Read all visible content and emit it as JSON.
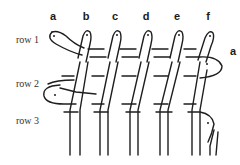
{
  "diagram": {
    "type": "weaving-pattern",
    "strand_labels": [
      {
        "label": "a",
        "x": 53,
        "y": 14
      },
      {
        "label": "b",
        "x": 86,
        "y": 14
      },
      {
        "label": "c",
        "x": 115,
        "y": 14
      },
      {
        "label": "d",
        "x": 146,
        "y": 14
      },
      {
        "label": "e",
        "x": 177,
        "y": 14
      },
      {
        "label": "f",
        "x": 208,
        "y": 14
      }
    ],
    "side_label": {
      "label": "a",
      "x": 233,
      "y": 47
    },
    "row_labels": [
      {
        "label": "row 1",
        "y": 34
      },
      {
        "label": "row 2",
        "y": 78
      },
      {
        "label": "row 3",
        "y": 115
      }
    ],
    "colors": {
      "stroke": "#1e1e1e",
      "text": "#1a1a1a",
      "background": "#ffffff"
    }
  }
}
